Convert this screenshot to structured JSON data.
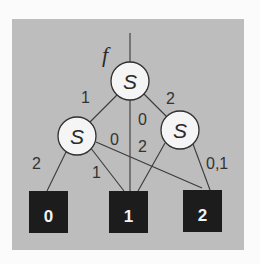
{
  "diagram": {
    "type": "decision-diagram",
    "colors": {
      "background": "#fbfbfb",
      "panel": "#bdbdbd",
      "node_fill": "#f5f5f5",
      "leaf_fill": "#1c1c1c",
      "leaf_text": "#f2f2f2",
      "line": "#3a3a3a"
    },
    "function_label": "f",
    "nodes": [
      {
        "id": "root",
        "label": "S",
        "cx": 130,
        "cy": 81,
        "r": 19
      },
      {
        "id": "left",
        "label": "S",
        "cx": 77,
        "cy": 136,
        "r": 19
      },
      {
        "id": "right",
        "label": "S",
        "cx": 180,
        "cy": 130,
        "r": 19
      }
    ],
    "leaves": [
      {
        "id": "leaf0",
        "label": "0",
        "x": 29,
        "y": 191,
        "w": 39,
        "h": 42
      },
      {
        "id": "leaf1",
        "label": "1",
        "x": 109,
        "y": 191,
        "w": 39,
        "h": 42
      },
      {
        "id": "leaf2",
        "label": "2",
        "x": 183,
        "y": 190,
        "w": 39,
        "h": 42
      }
    ],
    "edges": [
      {
        "from": "root",
        "to": "left",
        "label": "1"
      },
      {
        "from": "root",
        "to": "right",
        "label": "2"
      },
      {
        "from": "root",
        "to": "leaf1",
        "label": "0"
      },
      {
        "from": "left",
        "to": "leaf0",
        "label": "2"
      },
      {
        "from": "left",
        "to": "leaf1",
        "label": "1"
      },
      {
        "from": "left",
        "to": "leaf2",
        "label": "0"
      },
      {
        "from": "right",
        "to": "leaf1",
        "label": "2"
      },
      {
        "from": "right",
        "to": "leaf2",
        "label": "0,1"
      }
    ],
    "edge_labels": {
      "root_left": "1",
      "root_right": "2",
      "root_leaf1": "0",
      "left_leaf2": "0",
      "right_leaf1": "2",
      "left_leaf0": "2",
      "left_leaf1": "1",
      "right_leaf2": "0,1"
    }
  }
}
